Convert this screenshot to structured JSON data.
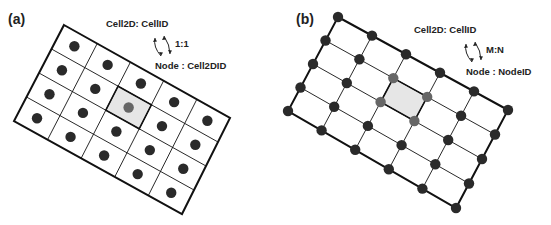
{
  "panels": [
    {
      "id": "a",
      "label": "(a)",
      "title": "Cell2D: CellID",
      "relation": "1:1",
      "subtitle": "Node : Cell2DID",
      "corners": {
        "tl": [
          64,
          25
        ],
        "tr": [
          230,
          118
        ],
        "br": [
          182,
          214
        ],
        "bl": [
          14,
          121
        ]
      },
      "cols": 5,
      "rows": 4,
      "highlight_cell": [
        2,
        1
      ],
      "node_mode": "centers"
    },
    {
      "id": "b",
      "label": "(b)",
      "title": "Cell2D: CellID",
      "relation": "M:N",
      "subtitle": "Node : NodeID",
      "corners": {
        "tl": [
          338,
          17
        ],
        "tr": [
          508,
          110
        ],
        "br": [
          456,
          208
        ],
        "bl": [
          288,
          111
        ]
      },
      "cols": 5,
      "rows": 4,
      "highlight_cell": [
        2,
        1
      ],
      "node_mode": "corners"
    }
  ],
  "colors": {
    "line": "#111111",
    "node": "#2a2a2a",
    "node_highlight": "#666666",
    "cell_highlight": "#e6e6e6"
  }
}
